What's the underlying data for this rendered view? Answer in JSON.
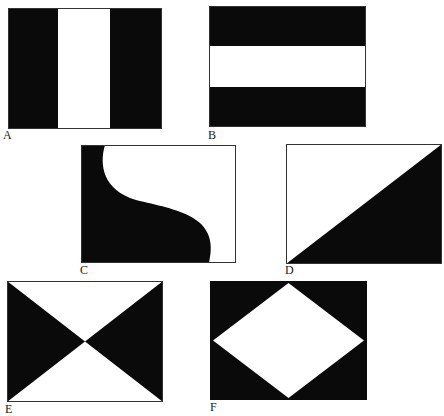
{
  "figure": {
    "colors": {
      "dark": "#0a0a0a",
      "light": "#ffffff",
      "border": "#333333"
    },
    "panels": [
      {
        "id": "A",
        "label": "A",
        "pattern": "vertical-tricolor (black-white-black)"
      },
      {
        "id": "B",
        "label": "B",
        "pattern": "horizontal-tricolor (black-white-black)"
      },
      {
        "id": "C",
        "label": "C",
        "pattern": "S-curve split, black left"
      },
      {
        "id": "D",
        "label": "D",
        "pattern": "diagonal split, black lower-right"
      },
      {
        "id": "E",
        "label": "E",
        "pattern": "hourglass, black left and right triangles"
      },
      {
        "id": "F",
        "label": "F",
        "pattern": "white diamond on black"
      }
    ]
  }
}
